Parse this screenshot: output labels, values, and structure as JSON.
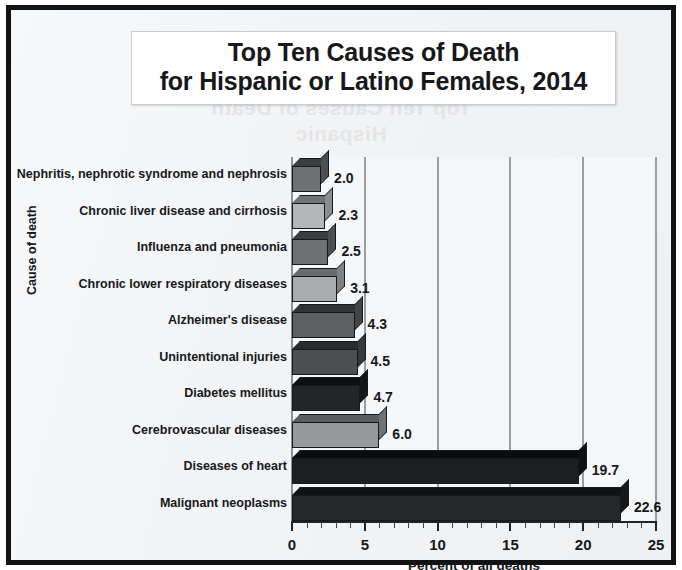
{
  "chart_data": {
    "type": "bar",
    "orientation": "horizontal",
    "title": "Top Ten Causes of Death for Hispanic or Latino Females, 2014",
    "title_lines": [
      "Top Ten Causes of Death",
      "for Hispanic or Latino Females, 2014"
    ],
    "xlabel": "Percent of all deaths",
    "ylabel": "Cause of death",
    "xlim": [
      0,
      25
    ],
    "xticks": [
      "0",
      "5",
      "10",
      "15",
      "20",
      "25"
    ],
    "xtick_values": [
      0,
      5,
      10,
      15,
      20,
      25
    ],
    "minor_tick_interval": 1,
    "grid": "vertical",
    "legend": "none",
    "categories": [
      "Nephritis, nephrotic syndrome and nephrosis",
      "Chronic liver disease and cirrhosis",
      "Influenza and pneumonia",
      "Chronic lower respiratory diseases",
      "Alzheimer's disease",
      "Unintentional injuries",
      "Diabetes mellitus",
      "Cerebrovascular diseases",
      "Diseases of heart",
      "Malignant neoplasms"
    ],
    "values": [
      2.0,
      2.3,
      2.5,
      3.1,
      4.3,
      4.5,
      4.7,
      6.0,
      19.7,
      22.6
    ],
    "value_labels": [
      "2.0",
      "2.3",
      "2.5",
      "3.1",
      "4.3",
      "4.5",
      "4.7",
      "6.0",
      "19.7",
      "22.6"
    ],
    "bar_colors": [
      "#6e7072",
      "#b4b6b8",
      "#6e7072",
      "#a9abad",
      "#5c5e60",
      "#4c4e50",
      "#232527",
      "#96989a",
      "#1c1e20",
      "#26282a"
    ],
    "bar_side_colors": [
      "#4d4f51",
      "#8a8c8e",
      "#4d4f51",
      "#808284",
      "#414345",
      "#363839",
      "#141516",
      "#6f7173",
      "#101112",
      "#171819"
    ],
    "bar_top_colors": [
      "#3b3d3f",
      "#707274",
      "#3b3d3f",
      "#686a6c",
      "#313335",
      "#292b2c",
      "#0e0f10",
      "#5a5c5e",
      "#0b0c0d",
      "#111213"
    ]
  },
  "ghost_text": {
    "line1": "Top Ten Causes of Death",
    "line2": "Hispanic"
  }
}
